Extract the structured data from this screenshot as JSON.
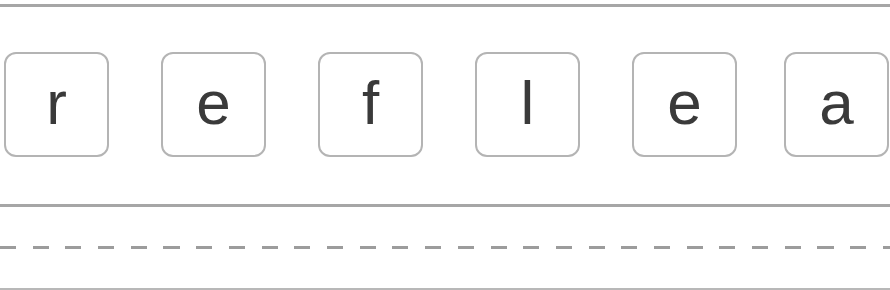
{
  "tiles": [
    {
      "letter": "r"
    },
    {
      "letter": "e"
    },
    {
      "letter": "f"
    },
    {
      "letter": "l"
    },
    {
      "letter": "e"
    },
    {
      "letter": "a"
    }
  ],
  "colors": {
    "rule": "#a6a6a6",
    "tile_border": "#b4b4b4",
    "letter": "#3a3a3a",
    "background": "#ffffff"
  }
}
